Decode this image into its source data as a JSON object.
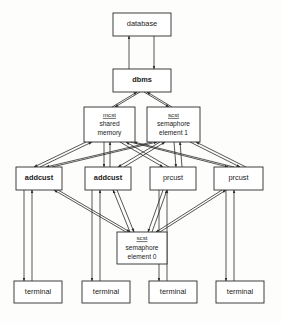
{
  "diagram": {
    "type": "block-diagram",
    "colors": {
      "background": "#fdfdfb",
      "box_fill": "#ffffff",
      "box_stroke": "#2b2b2b",
      "edge_stroke": "#2b2b2b",
      "text": "#1a1a1a"
    },
    "nodes": [
      {
        "id": "database",
        "label": "database",
        "lines": [
          "database"
        ],
        "x": 113,
        "y": 13,
        "w": 58,
        "h": 23,
        "style": "single"
      },
      {
        "id": "dbms",
        "label": "dbms",
        "lines": [
          "dbms"
        ],
        "x": 113,
        "y": 69,
        "w": 58,
        "h": 23,
        "style": "single-bold"
      },
      {
        "id": "mcst-shared-memory",
        "label": "mcst shared memory",
        "key": "mcst",
        "lines": [
          "shared",
          "memory"
        ],
        "x": 84,
        "y": 107,
        "w": 51,
        "h": 35,
        "style": "keyed"
      },
      {
        "id": "scst-semaphore-element-1",
        "label": "scst semaphore element 1",
        "key": "scst",
        "lines": [
          "semaphore",
          "element 1"
        ],
        "x": 147,
        "y": 107,
        "w": 53,
        "h": 35,
        "style": "keyed"
      },
      {
        "id": "addcust-1",
        "label": "addcust",
        "lines": [
          "addcust"
        ],
        "x": 16,
        "y": 167,
        "w": 46,
        "h": 23,
        "style": "single-bold"
      },
      {
        "id": "addcust-2",
        "label": "addcust",
        "lines": [
          "addcust"
        ],
        "x": 85,
        "y": 167,
        "w": 46,
        "h": 23,
        "style": "single-bold"
      },
      {
        "id": "prcust-1",
        "label": "prcust",
        "lines": [
          "prcust"
        ],
        "x": 150,
        "y": 167,
        "w": 46,
        "h": 23,
        "style": "single"
      },
      {
        "id": "prcust-2",
        "label": "prcust",
        "lines": [
          "prcust"
        ],
        "x": 214,
        "y": 167,
        "w": 49,
        "h": 23,
        "style": "single"
      },
      {
        "id": "scst-semaphore-element-0",
        "label": "scst semaphore element 0",
        "key": "scst",
        "lines": [
          "semaphore",
          "element 0"
        ],
        "x": 117,
        "y": 232,
        "w": 50,
        "h": 32,
        "style": "keyed"
      },
      {
        "id": "terminal-1",
        "label": "terminal",
        "lines": [
          "terminal"
        ],
        "x": 14,
        "y": 281,
        "w": 48,
        "h": 22,
        "style": "single"
      },
      {
        "id": "terminal-2",
        "label": "terminal",
        "lines": [
          "terminal"
        ],
        "x": 82,
        "y": 281,
        "w": 48,
        "h": 22,
        "style": "single"
      },
      {
        "id": "terminal-3",
        "label": "terminal",
        "lines": [
          "terminal"
        ],
        "x": 149,
        "y": 281,
        "w": 48,
        "h": 22,
        "style": "single"
      },
      {
        "id": "terminal-4",
        "label": "terminal",
        "lines": [
          "terminal"
        ],
        "x": 216,
        "y": 281,
        "w": 48,
        "h": 22,
        "style": "single"
      }
    ],
    "edges": [
      {
        "from": "dbms",
        "to": "database",
        "points": [
          [
            129,
            69
          ],
          [
            129,
            36
          ]
        ],
        "arrow": "end"
      },
      {
        "from": "database",
        "to": "dbms",
        "points": [
          [
            154,
            36
          ],
          [
            154,
            69
          ]
        ],
        "arrow": "end"
      },
      {
        "from": "mcst-shared-memory",
        "to": "dbms",
        "points": [
          [
            112,
            107
          ],
          [
            137,
            92
          ]
        ],
        "arrow": "end"
      },
      {
        "from": "dbms",
        "to": "mcst-shared-memory",
        "points": [
          [
            140,
            92
          ],
          [
            115,
            107
          ]
        ],
        "arrow": "end"
      },
      {
        "from": "scst-semaphore-element-1",
        "to": "dbms",
        "points": [
          [
            172,
            107
          ],
          [
            147,
            92
          ]
        ],
        "arrow": "end"
      },
      {
        "from": "dbms",
        "to": "scst-semaphore-element-1",
        "points": [
          [
            144,
            92
          ],
          [
            169,
            107
          ]
        ],
        "arrow": "end"
      },
      {
        "from": "mcst-shared-memory",
        "to": "addcust-1",
        "points": [
          [
            86,
            142
          ],
          [
            34,
            167
          ]
        ],
        "arrow": "end"
      },
      {
        "from": "addcust-1",
        "to": "mcst-shared-memory",
        "points": [
          [
            40,
            167
          ],
          [
            92,
            142
          ]
        ],
        "arrow": "end"
      },
      {
        "from": "mcst-shared-memory",
        "to": "addcust-2",
        "points": [
          [
            104,
            142
          ],
          [
            104,
            167
          ]
        ],
        "arrow": "end"
      },
      {
        "from": "addcust-2",
        "to": "mcst-shared-memory",
        "points": [
          [
            110,
            167
          ],
          [
            110,
            142
          ]
        ],
        "arrow": "end"
      },
      {
        "from": "mcst-shared-memory",
        "to": "prcust-1",
        "points": [
          [
            120,
            142
          ],
          [
            163,
            167
          ]
        ],
        "arrow": "end"
      },
      {
        "from": "prcust-1",
        "to": "mcst-shared-memory",
        "points": [
          [
            169,
            167
          ],
          [
            126,
            142
          ]
        ],
        "arrow": "end"
      },
      {
        "from": "mcst-shared-memory",
        "to": "prcust-2",
        "points": [
          [
            130,
            142
          ],
          [
            228,
            167
          ]
        ],
        "arrow": "end"
      },
      {
        "from": "prcust-2",
        "to": "mcst-shared-memory",
        "points": [
          [
            234,
            167
          ],
          [
            134,
            142
          ]
        ],
        "arrow": "end"
      },
      {
        "from": "scst-semaphore-element-1",
        "to": "addcust-1",
        "points": [
          [
            152,
            142
          ],
          [
            46,
            167
          ]
        ],
        "arrow": "end"
      },
      {
        "from": "addcust-1",
        "to": "scst-semaphore-element-1",
        "points": [
          [
            52,
            167
          ],
          [
            157,
            142
          ]
        ],
        "arrow": "end"
      },
      {
        "from": "scst-semaphore-element-1",
        "to": "addcust-2",
        "points": [
          [
            160,
            142
          ],
          [
            118,
            167
          ]
        ],
        "arrow": "end"
      },
      {
        "from": "addcust-2",
        "to": "scst-semaphore-element-1",
        "points": [
          [
            124,
            167
          ],
          [
            165,
            142
          ]
        ],
        "arrow": "end"
      },
      {
        "from": "scst-semaphore-element-1",
        "to": "prcust-1",
        "points": [
          [
            174,
            142
          ],
          [
            176,
            167
          ]
        ],
        "arrow": "end"
      },
      {
        "from": "prcust-1",
        "to": "scst-semaphore-element-1",
        "points": [
          [
            182,
            167
          ],
          [
            180,
            142
          ]
        ],
        "arrow": "end"
      },
      {
        "from": "scst-semaphore-element-1",
        "to": "prcust-2",
        "points": [
          [
            190,
            142
          ],
          [
            240,
            167
          ]
        ],
        "arrow": "end"
      },
      {
        "from": "prcust-2",
        "to": "scst-semaphore-element-1",
        "points": [
          [
            246,
            167
          ],
          [
            196,
            142
          ]
        ],
        "arrow": "end"
      },
      {
        "from": "addcust-1",
        "to": "scst-semaphore-element-0",
        "points": [
          [
            58,
            190
          ],
          [
            130,
            232
          ]
        ],
        "arrow": "end"
      },
      {
        "from": "scst-semaphore-element-0",
        "to": "addcust-1",
        "points": [
          [
            126,
            232
          ],
          [
            54,
            190
          ]
        ],
        "arrow": "end"
      },
      {
        "from": "addcust-2",
        "to": "scst-semaphore-element-0",
        "points": [
          [
            117,
            190
          ],
          [
            134,
            232
          ]
        ],
        "arrow": "end"
      },
      {
        "from": "scst-semaphore-element-0",
        "to": "addcust-2",
        "points": [
          [
            130,
            232
          ],
          [
            113,
            190
          ]
        ],
        "arrow": "end"
      },
      {
        "from": "prcust-1",
        "to": "scst-semaphore-element-0",
        "points": [
          [
            163,
            190
          ],
          [
            148,
            232
          ]
        ],
        "arrow": "end"
      },
      {
        "from": "scst-semaphore-element-0",
        "to": "prcust-1",
        "points": [
          [
            152,
            232
          ],
          [
            167,
            190
          ]
        ],
        "arrow": "end"
      },
      {
        "from": "prcust-2",
        "to": "scst-semaphore-element-0",
        "points": [
          [
            222,
            190
          ],
          [
            156,
            232
          ]
        ],
        "arrow": "end"
      },
      {
        "from": "scst-semaphore-element-0",
        "to": "prcust-2",
        "points": [
          [
            160,
            232
          ],
          [
            226,
            190
          ]
        ],
        "arrow": "end"
      },
      {
        "from": "addcust-1",
        "to": "terminal-1",
        "points": [
          [
            24,
            190
          ],
          [
            24,
            281
          ]
        ],
        "arrow": "end"
      },
      {
        "from": "terminal-1",
        "to": "addcust-1",
        "points": [
          [
            32,
            281
          ],
          [
            32,
            190
          ]
        ],
        "arrow": "end"
      },
      {
        "from": "addcust-2",
        "to": "terminal-2",
        "points": [
          [
            92,
            190
          ],
          [
            92,
            281
          ]
        ],
        "arrow": "end"
      },
      {
        "from": "terminal-2",
        "to": "addcust-2",
        "points": [
          [
            100,
            281
          ],
          [
            100,
            190
          ]
        ],
        "arrow": "end"
      },
      {
        "from": "prcust-1",
        "to": "terminal-3",
        "points": [
          [
            159,
            190
          ],
          [
            159,
            281
          ]
        ],
        "arrow": "end"
      },
      {
        "from": "terminal-3",
        "to": "prcust-1",
        "points": [
          [
            167,
            281
          ],
          [
            167,
            190
          ]
        ],
        "arrow": "end"
      },
      {
        "from": "prcust-2",
        "to": "terminal-4",
        "points": [
          [
            226,
            190
          ],
          [
            226,
            281
          ]
        ],
        "arrow": "end"
      },
      {
        "from": "terminal-4",
        "to": "prcust-2",
        "points": [
          [
            234,
            281
          ],
          [
            234,
            190
          ]
        ],
        "arrow": "end"
      }
    ]
  }
}
